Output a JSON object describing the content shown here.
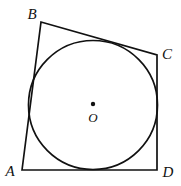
{
  "figure": {
    "type": "geometry-diagram",
    "canvas": {
      "width": 181,
      "height": 186
    },
    "colors": {
      "background": "#ffffff",
      "stroke": "#111111",
      "label": "#111111"
    },
    "stroke_width": 1.7,
    "quadrilateral": {
      "name": "ABCD",
      "vertices": [
        {
          "id": "A",
          "label": "A",
          "x": 22,
          "y": 170,
          "label_x": 10,
          "label_y": 171
        },
        {
          "id": "B",
          "label": "B",
          "x": 41,
          "y": 22,
          "label_x": 32,
          "label_y": 14
        },
        {
          "id": "C",
          "label": "C",
          "x": 157,
          "y": 55,
          "label_x": 167,
          "label_y": 54
        },
        {
          "id": "D",
          "label": "D",
          "x": 157,
          "y": 170,
          "label_x": 168,
          "label_y": 172
        }
      ],
      "sides": [
        "AB",
        "BC",
        "CD",
        "DA"
      ],
      "path": "M 22 170 L 41 22 L 157 55 L 157 170 Z"
    },
    "incircle": {
      "center": {
        "id": "O",
        "label": "O",
        "x": 93,
        "y": 105
      },
      "radius": 64.5,
      "center_dot": {
        "x": 93,
        "y": 104,
        "radius": 2.2
      },
      "center_label_x": 93,
      "center_label_y": 117,
      "tangent_to": [
        "AB",
        "BC",
        "CD",
        "DA"
      ]
    }
  }
}
